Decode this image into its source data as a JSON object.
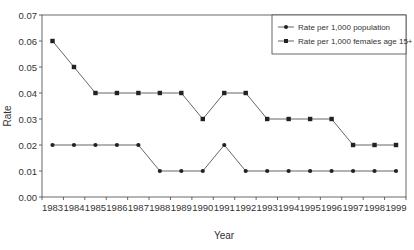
{
  "chart_data": {
    "type": "line",
    "title": "",
    "xlabel": "Year",
    "ylabel": "Rate",
    "ylim": [
      0,
      0.07
    ],
    "yticks": [
      "0.00",
      "0.01",
      "0.02",
      "0.03",
      "0.04",
      "0.05",
      "0.06",
      "0.07"
    ],
    "grid": false,
    "legend_position": "upper right, inside plot",
    "x": [
      "1983",
      "1984",
      "1985",
      "1986",
      "1987",
      "1988",
      "1989",
      "1990",
      "1991",
      "1992",
      "1993",
      "1994",
      "1995",
      "1996",
      "1997",
      "1998",
      "1999"
    ],
    "series": [
      {
        "name": "Rate per 1,000 population",
        "marker": "circle",
        "values": [
          0.02,
          0.02,
          0.02,
          0.02,
          0.02,
          0.01,
          0.01,
          0.01,
          0.02,
          0.01,
          0.01,
          0.01,
          0.01,
          0.01,
          0.01,
          0.01,
          0.01
        ]
      },
      {
        "name": "Rate per 1,000 females age 15+",
        "marker": "square",
        "values": [
          0.06,
          0.05,
          0.04,
          0.04,
          0.04,
          0.04,
          0.04,
          0.03,
          0.04,
          0.04,
          0.03,
          0.03,
          0.03,
          0.03,
          0.02,
          0.02,
          0.02
        ]
      }
    ]
  },
  "colors": {
    "line": "#555555",
    "marker": "#222222",
    "axis": "#444444",
    "text": "#333333",
    "background": "#ffffff"
  }
}
